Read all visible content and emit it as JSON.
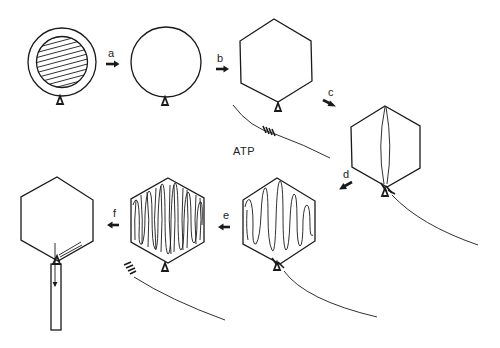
{
  "diagram": {
    "steps": [
      {
        "label": "a",
        "from": "prohead-with-scaffold",
        "to": "empty-prohead"
      },
      {
        "label": "b",
        "from": "empty-prohead",
        "to": "expanded-capsid"
      },
      {
        "label": "c",
        "from": "expanded-capsid",
        "to": "dna-entering-capsid"
      },
      {
        "label": "d",
        "from": "dna-entering-capsid",
        "to": "partially-filled-capsid"
      },
      {
        "label": "e",
        "from": "partially-filled-capsid",
        "to": "full-capsid"
      },
      {
        "label": "f",
        "from": "full-capsid",
        "to": "capsid-with-tail"
      }
    ],
    "annotations": {
      "atp": "ATP"
    },
    "colors": {
      "stroke": "#1a1a1a",
      "background": "#ffffff"
    }
  }
}
